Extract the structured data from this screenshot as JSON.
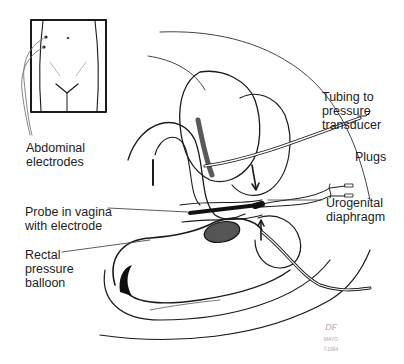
{
  "figure": {
    "type": "anatomical line illustration"
  },
  "labels": {
    "abdominal_electrodes": "Abdominal\nelectrodes",
    "tubing": "Tubing to\npressure\ntransducer",
    "plugs": "Plugs",
    "urogenital_diaphragm": "Urogenital\ndiaphragm",
    "probe": "Probe in vagina\nwith electrode",
    "rectal_balloon": "Rectal\npressure\nballoon"
  },
  "signature": {
    "initials": "DF",
    "line1": "MAYO",
    "line2": "©1994"
  },
  "colors": {
    "ink": "#1a1a1a",
    "shade": "#333333",
    "paper": "#ffffff"
  }
}
